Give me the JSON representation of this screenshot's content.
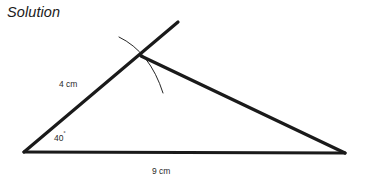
{
  "page": {
    "title": "Solution",
    "background_color": "#ffffff",
    "width": 371,
    "height": 187
  },
  "figure": {
    "name": "triangle-construction",
    "stroke_color": "#1a1a1a",
    "thick_stroke_width": 3.2,
    "thin_stroke_width": 0.9,
    "vertices": {
      "left": {
        "x": 24,
        "y": 152
      },
      "right": {
        "x": 345,
        "y": 153
      },
      "apex": {
        "x": 141,
        "y": 56
      }
    },
    "ray_extension_end": {
      "x": 178,
      "y": 22
    },
    "construction_arc": {
      "start": {
        "x": 119,
        "y": 37
      },
      "control": {
        "x": 150,
        "y": 52
      },
      "end": {
        "x": 163,
        "y": 93
      }
    },
    "labels": {
      "side_a": "4 cm",
      "angle": "40",
      "degree_symbol": "˚",
      "side_b": "9 cm"
    }
  }
}
